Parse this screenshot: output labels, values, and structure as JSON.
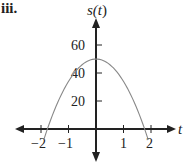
{
  "part_label": "iii.",
  "chart_data": {
    "type": "line",
    "title": "",
    "xlabel": "t",
    "ylabel": "s(t)",
    "xlim": [
      -2.9,
      2.9
    ],
    "ylim": [
      -10,
      75
    ],
    "x_ticks": [
      -2,
      -1,
      1,
      2
    ],
    "x_tick_labels": [
      "-2",
      "-1",
      "1",
      "2"
    ],
    "y_ticks": [
      20,
      40,
      60
    ],
    "y_tick_labels": [
      "20",
      "40",
      "60"
    ],
    "grid": false,
    "legend": null,
    "series": [
      {
        "name": "s(t)",
        "description": "downward parabola, s(t) ≈ 50 - 16t^2",
        "color": "#888888",
        "x": [
          -1.9,
          -1.77,
          -1.5,
          -1.0,
          -0.5,
          0,
          0.5,
          1.0,
          1.5,
          1.77,
          1.9
        ],
        "y": [
          -7.8,
          0,
          14,
          34,
          46,
          50,
          46,
          34,
          14,
          0,
          -7.8
        ]
      }
    ]
  },
  "labels": {
    "x_axis": "t",
    "y_axis_s": "s(",
    "y_axis_t": "t",
    "y_axis_close": ")",
    "tick_neg2": "−2",
    "tick_neg1": "−1",
    "tick_1": "1",
    "tick_2": "2",
    "tick_20": "20",
    "tick_40": "40",
    "tick_60": "60"
  }
}
